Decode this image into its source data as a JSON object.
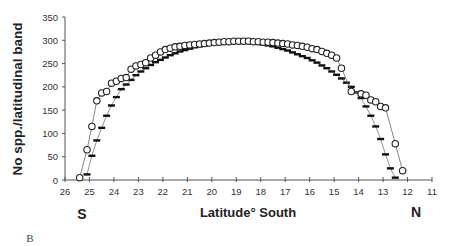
{
  "chart_data": {
    "type": "line",
    "title": "",
    "xlabel": "Latitude° South",
    "ylabel": "No spp./latitudinal band",
    "xlim": [
      26,
      11
    ],
    "ylim": [
      0,
      350
    ],
    "x_ticks": [
      26,
      25,
      24,
      23,
      22,
      21,
      20,
      19,
      18,
      17,
      16,
      15,
      14,
      13,
      12,
      11
    ],
    "y_ticks": [
      0,
      50,
      100,
      150,
      200,
      250,
      300,
      350
    ],
    "grid": false,
    "legend": null,
    "annotations": {
      "left_end": "S",
      "right_end": "N",
      "panel": "B"
    },
    "series": [
      {
        "name": "observed (circles)",
        "marker": "circle",
        "x": [
          25.4,
          25.1,
          24.9,
          24.7,
          24.5,
          24.3,
          24.1,
          23.9,
          23.7,
          23.5,
          23.3,
          23.1,
          22.9,
          22.7,
          22.5,
          22.3,
          22.1,
          21.9,
          21.7,
          21.5,
          21.3,
          21.1,
          20.9,
          20.7,
          20.5,
          20.3,
          20.1,
          19.9,
          19.7,
          19.5,
          19.3,
          19.1,
          18.9,
          18.7,
          18.5,
          18.3,
          18.1,
          17.9,
          17.7,
          17.5,
          17.3,
          17.1,
          16.9,
          16.7,
          16.5,
          16.3,
          16.1,
          15.9,
          15.7,
          15.5,
          15.3,
          15.1,
          14.9,
          14.7,
          14.3,
          13.9,
          13.7,
          13.5,
          13.3,
          13.1,
          12.9,
          12.5,
          12.2
        ],
        "values": [
          5,
          65,
          115,
          170,
          187,
          190,
          208,
          212,
          218,
          220,
          238,
          245,
          248,
          252,
          262,
          268,
          275,
          280,
          283,
          286,
          287,
          289,
          290,
          291,
          292,
          293,
          294,
          295,
          296,
          297,
          297,
          298,
          298,
          298,
          298,
          297,
          297,
          296,
          296,
          295,
          294,
          293,
          292,
          290,
          289,
          287,
          285,
          282,
          280,
          276,
          272,
          268,
          262,
          240,
          190,
          185,
          182,
          172,
          168,
          158,
          155,
          78,
          20
        ]
      },
      {
        "name": "predicted (dashes)",
        "marker": "dash",
        "x": [
          25.1,
          24.9,
          24.7,
          24.5,
          24.3,
          24.1,
          23.9,
          23.7,
          23.5,
          23.3,
          23.1,
          22.9,
          22.7,
          22.5,
          22.3,
          22.1,
          21.9,
          21.7,
          21.5,
          21.3,
          21.1,
          20.9,
          20.7,
          20.5,
          20.3,
          20.1,
          19.9,
          19.7,
          19.5,
          19.3,
          19.1,
          18.9,
          18.7,
          18.5,
          18.3,
          18.1,
          17.9,
          17.7,
          17.5,
          17.3,
          17.1,
          16.9,
          16.7,
          16.5,
          16.3,
          16.1,
          15.9,
          15.7,
          15.5,
          15.3,
          15.1,
          14.9,
          14.7,
          14.5,
          14.3,
          14.1,
          13.9,
          13.7,
          13.5,
          13.3,
          13.1,
          12.9,
          12.7,
          12.5
        ],
        "values": [
          12,
          52,
          85,
          112,
          138,
          160,
          178,
          195,
          205,
          215,
          225,
          233,
          240,
          247,
          253,
          258,
          263,
          268,
          272,
          276,
          279,
          282,
          285,
          287,
          289,
          291,
          293,
          294,
          295,
          296,
          296,
          297,
          296,
          295,
          294,
          293,
          291,
          289,
          287,
          284,
          281,
          278,
          274,
          270,
          266,
          262,
          257,
          252,
          246,
          240,
          233,
          226,
          218,
          209,
          200,
          188,
          176,
          158,
          138,
          115,
          88,
          55,
          25,
          5
        ]
      }
    ]
  }
}
